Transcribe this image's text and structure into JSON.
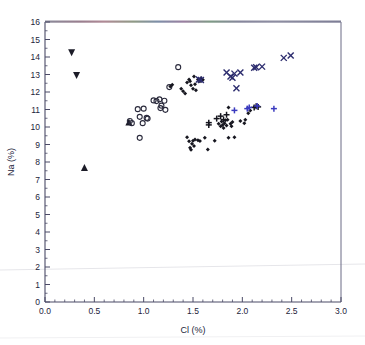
{
  "figure": {
    "background": "#ffffff",
    "frame_color": "#4a4a66",
    "plot_area": {
      "x": 45,
      "y": 22,
      "width": 296,
      "height": 280
    }
  },
  "chart_data": {
    "type": "scatter",
    "title": "",
    "xlabel": "Cl (%)",
    "ylabel": "Na (%)",
    "xlim": [
      0.0,
      3.0
    ],
    "ylim": [
      0,
      16
    ],
    "xticks": [
      0.0,
      0.5,
      1.0,
      1.5,
      2.0,
      2.5,
      3.0
    ],
    "xticklabels": [
      "0.0",
      "0.5",
      "1.0",
      "1.5",
      "2.0",
      "2.5",
      "3.0"
    ],
    "yticks": [
      0,
      1,
      2,
      3,
      4,
      5,
      6,
      7,
      8,
      9,
      10,
      11,
      12,
      13,
      14,
      15,
      16
    ],
    "yticklabels": [
      "0",
      "1",
      "2",
      "3",
      "4",
      "5",
      "6",
      "7",
      "8",
      "9",
      "10",
      "11",
      "12",
      "13",
      "14",
      "15",
      "16"
    ],
    "x_minor_ticks_per_major": 5,
    "y_minor_ticks_per_major": 2,
    "grid": false,
    "legend": false,
    "legend_position": "none",
    "series": [
      {
        "name": "down-triangle",
        "marker": "triangle-down",
        "color": "#1c1c28",
        "size": 7,
        "points": [
          {
            "x": 0.27,
            "y": 14.25
          },
          {
            "x": 0.32,
            "y": 12.95
          }
        ]
      },
      {
        "name": "up-triangle",
        "marker": "triangle-up",
        "color": "#1c1c28",
        "size": 7,
        "points": [
          {
            "x": 0.4,
            "y": 7.68
          },
          {
            "x": 0.85,
            "y": 10.28
          }
        ]
      },
      {
        "name": "open-circle",
        "marker": "circle-open",
        "color": "#2a2a3c",
        "size": 5,
        "points": [
          {
            "x": 0.86,
            "y": 10.34
          },
          {
            "x": 0.88,
            "y": 10.22
          },
          {
            "x": 0.94,
            "y": 11.02
          },
          {
            "x": 0.96,
            "y": 10.58
          },
          {
            "x": 0.96,
            "y": 9.38
          },
          {
            "x": 0.99,
            "y": 10.22
          },
          {
            "x": 1.0,
            "y": 11.05
          },
          {
            "x": 1.03,
            "y": 10.52
          },
          {
            "x": 1.04,
            "y": 10.48
          },
          {
            "x": 1.1,
            "y": 11.52
          },
          {
            "x": 1.13,
            "y": 11.48
          },
          {
            "x": 1.16,
            "y": 11.58
          },
          {
            "x": 1.17,
            "y": 11.08
          },
          {
            "x": 1.18,
            "y": 11.22
          },
          {
            "x": 1.21,
            "y": 11.5
          },
          {
            "x": 1.22,
            "y": 10.98
          },
          {
            "x": 1.26,
            "y": 12.28
          },
          {
            "x": 1.35,
            "y": 13.42
          }
        ]
      },
      {
        "name": "filled-diamond",
        "marker": "diamond-filled",
        "color": "#16161f",
        "size": 4,
        "points": [
          {
            "x": 1.27,
            "y": 12.32
          },
          {
            "x": 1.29,
            "y": 12.42
          },
          {
            "x": 1.38,
            "y": 12.18
          },
          {
            "x": 1.4,
            "y": 12.05
          },
          {
            "x": 1.42,
            "y": 11.92
          },
          {
            "x": 1.44,
            "y": 12.55
          },
          {
            "x": 1.46,
            "y": 12.72
          },
          {
            "x": 1.47,
            "y": 12.62
          },
          {
            "x": 1.48,
            "y": 12.38
          },
          {
            "x": 1.5,
            "y": 12.18
          },
          {
            "x": 1.51,
            "y": 12.88
          },
          {
            "x": 1.52,
            "y": 12.45
          },
          {
            "x": 1.53,
            "y": 12.1
          },
          {
            "x": 1.55,
            "y": 12.72
          },
          {
            "x": 1.57,
            "y": 12.62
          },
          {
            "x": 1.58,
            "y": 12.78
          },
          {
            "x": 1.6,
            "y": 12.7
          },
          {
            "x": 1.44,
            "y": 9.42
          },
          {
            "x": 1.46,
            "y": 9.18
          },
          {
            "x": 1.47,
            "y": 8.82
          },
          {
            "x": 1.48,
            "y": 8.7
          },
          {
            "x": 1.49,
            "y": 9.05
          },
          {
            "x": 1.5,
            "y": 9.22
          },
          {
            "x": 1.51,
            "y": 8.92
          },
          {
            "x": 1.52,
            "y": 9.28
          },
          {
            "x": 1.55,
            "y": 9.25
          },
          {
            "x": 1.57,
            "y": 9.2
          },
          {
            "x": 1.62,
            "y": 9.38
          },
          {
            "x": 1.65,
            "y": 8.72
          },
          {
            "x": 1.72,
            "y": 9.22
          },
          {
            "x": 1.76,
            "y": 10.18
          },
          {
            "x": 1.78,
            "y": 10.05
          },
          {
            "x": 1.79,
            "y": 10.32
          },
          {
            "x": 1.8,
            "y": 10.12
          },
          {
            "x": 1.81,
            "y": 9.95
          },
          {
            "x": 1.82,
            "y": 10.22
          },
          {
            "x": 1.83,
            "y": 10.38
          },
          {
            "x": 1.84,
            "y": 10.08
          },
          {
            "x": 1.85,
            "y": 10.42
          },
          {
            "x": 1.86,
            "y": 9.38
          },
          {
            "x": 1.86,
            "y": 11.12
          },
          {
            "x": 1.88,
            "y": 10.18
          },
          {
            "x": 1.89,
            "y": 10.05
          },
          {
            "x": 1.9,
            "y": 10.28
          },
          {
            "x": 1.92,
            "y": 9.42
          },
          {
            "x": 1.98,
            "y": 10.35
          },
          {
            "x": 2.02,
            "y": 10.22
          },
          {
            "x": 2.03,
            "y": 10.42
          },
          {
            "x": 2.06,
            "y": 10.78
          },
          {
            "x": 2.08,
            "y": 10.95
          }
        ]
      },
      {
        "name": "black-plus",
        "marker": "plus",
        "color": "#15151e",
        "size": 6,
        "points": [
          {
            "x": 1.66,
            "y": 10.25
          },
          {
            "x": 1.66,
            "y": 10.12
          },
          {
            "x": 1.74,
            "y": 10.48
          },
          {
            "x": 1.78,
            "y": 10.62
          },
          {
            "x": 1.81,
            "y": 10.42
          },
          {
            "x": 1.84,
            "y": 10.7
          },
          {
            "x": 2.12,
            "y": 11.12
          },
          {
            "x": 2.14,
            "y": 11.18
          },
          {
            "x": 2.16,
            "y": 11.15
          }
        ]
      },
      {
        "name": "blue-plus",
        "marker": "plus",
        "color": "#3b3bbf",
        "size": 6,
        "points": [
          {
            "x": 1.92,
            "y": 10.95
          },
          {
            "x": 2.05,
            "y": 11.05
          },
          {
            "x": 2.07,
            "y": 11.12
          },
          {
            "x": 2.15,
            "y": 11.2
          },
          {
            "x": 2.32,
            "y": 11.05
          }
        ]
      },
      {
        "name": "cross-x",
        "marker": "x",
        "color": "#2c2c6e",
        "size": 6,
        "points": [
          {
            "x": 1.56,
            "y": 12.72
          },
          {
            "x": 1.58,
            "y": 12.68
          },
          {
            "x": 1.84,
            "y": 13.12
          },
          {
            "x": 1.88,
            "y": 12.88
          },
          {
            "x": 1.9,
            "y": 12.82
          },
          {
            "x": 1.92,
            "y": 13.05
          },
          {
            "x": 1.94,
            "y": 12.22
          },
          {
            "x": 1.98,
            "y": 13.12
          },
          {
            "x": 2.12,
            "y": 13.38
          },
          {
            "x": 2.14,
            "y": 13.42
          },
          {
            "x": 2.2,
            "y": 13.45
          },
          {
            "x": 2.42,
            "y": 13.95
          },
          {
            "x": 2.49,
            "y": 14.08
          }
        ]
      }
    ]
  }
}
